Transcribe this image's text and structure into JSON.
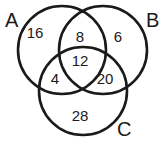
{
  "diagram": {
    "type": "venn-3",
    "sets": [
      {
        "id": "A",
        "label": "A",
        "cx": 62,
        "cy": 50,
        "r": 44,
        "label_x": 5,
        "label_y": 27
      },
      {
        "id": "B",
        "label": "B",
        "cx": 103,
        "cy": 50,
        "r": 44,
        "label_x": 146,
        "label_y": 27
      },
      {
        "id": "C",
        "label": "C",
        "cx": 83,
        "cy": 91,
        "r": 44,
        "label_x": 117,
        "label_y": 136
      }
    ],
    "regions": [
      {
        "id": "A_only",
        "value": "16",
        "x": 35,
        "y": 34
      },
      {
        "id": "A_B_only",
        "value": "8",
        "x": 80,
        "y": 38
      },
      {
        "id": "B_only",
        "value": "6",
        "x": 118,
        "y": 38
      },
      {
        "id": "A_B_C",
        "value": "12",
        "x": 80,
        "y": 62
      },
      {
        "id": "A_C_only",
        "value": "4",
        "x": 55,
        "y": 80
      },
      {
        "id": "B_C_only",
        "value": "20",
        "x": 105,
        "y": 80
      },
      {
        "id": "C_only",
        "value": "28",
        "x": 80,
        "y": 117
      }
    ]
  }
}
